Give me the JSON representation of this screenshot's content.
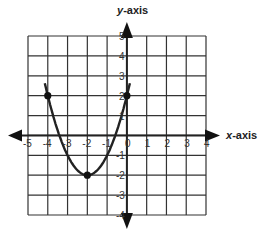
{
  "chart_data": {
    "type": "line",
    "title": "",
    "xlabel": "x-axis",
    "ylabel": "y-axis",
    "xlim": [
      -5,
      4
    ],
    "ylim": [
      -4,
      5
    ],
    "grid": true,
    "x_ticks": [
      "-5",
      "-4",
      "-3",
      "-2",
      "-1",
      "0",
      "1",
      "2",
      "3",
      "4"
    ],
    "y_ticks": [
      "5",
      "4",
      "3",
      "2",
      "1",
      "0",
      "-1",
      "-2",
      "-3",
      "-4"
    ],
    "series": [
      {
        "name": "parabola",
        "equation": "y = (x + 2)^2 - 2",
        "x": [
          -4.15,
          -4,
          -3,
          -2,
          -1,
          0,
          0.15
        ],
        "y": [
          2.62,
          2,
          -1,
          -2,
          -1,
          2,
          2.62
        ]
      }
    ],
    "marked_points": [
      {
        "x": -4,
        "y": 2
      },
      {
        "x": -2,
        "y": -2
      },
      {
        "x": 0,
        "y": 2
      }
    ]
  },
  "labels": {
    "x_axis": "x-axis",
    "y_axis": "y-axis",
    "x_axis_var": "x",
    "x_axis_rest": "-axis",
    "y_axis_var": "y",
    "y_axis_rest": "-axis"
  }
}
